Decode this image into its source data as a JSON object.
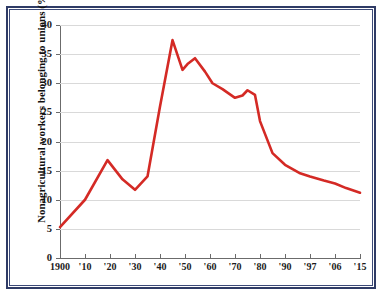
{
  "chart_data": {
    "type": "line",
    "title": "",
    "xlabel": "",
    "ylabel": "Nonagricultural workers belonging to unions (%)",
    "ylim": [
      0,
      40
    ],
    "ytick_values": [
      0,
      5,
      10,
      15,
      20,
      25,
      30,
      35,
      40
    ],
    "ytick_labels": [
      "0",
      "5",
      "10",
      "15",
      "20",
      "25",
      "30",
      "35",
      "40"
    ],
    "xtick_labels": [
      "1900",
      "'10",
      "'20",
      "'30",
      "'40",
      "'50",
      "'60",
      "'70",
      "'80",
      "'90",
      "'97",
      "'06",
      "'15"
    ],
    "xtick_years": [
      1900,
      1910,
      1920,
      1930,
      1940,
      1950,
      1960,
      1970,
      1980,
      1990,
      1997,
      2006,
      2015
    ],
    "grid": true,
    "legend": "none",
    "line_color": "#d42a25",
    "series": [
      {
        "name": "Nonagricultural workers belonging to unions",
        "x": [
          1900,
          1910,
          1919,
          1925,
          1930,
          1935,
          1940,
          1945,
          1949,
          1951,
          1954,
          1958,
          1961,
          1965,
          1970,
          1973,
          1975,
          1978,
          1980,
          1985,
          1990,
          1994,
          1997,
          2002,
          2006,
          2010,
          2015
        ],
        "values": [
          5.3,
          10.0,
          16.8,
          13.5,
          11.7,
          14.0,
          26.0,
          37.4,
          32.3,
          33.3,
          34.3,
          32.0,
          30.0,
          29.0,
          27.5,
          27.9,
          28.8,
          28.0,
          23.5,
          18.0,
          16.0,
          14.6,
          14.0,
          13.3,
          12.8,
          12.0,
          11.2
        ]
      }
    ]
  }
}
